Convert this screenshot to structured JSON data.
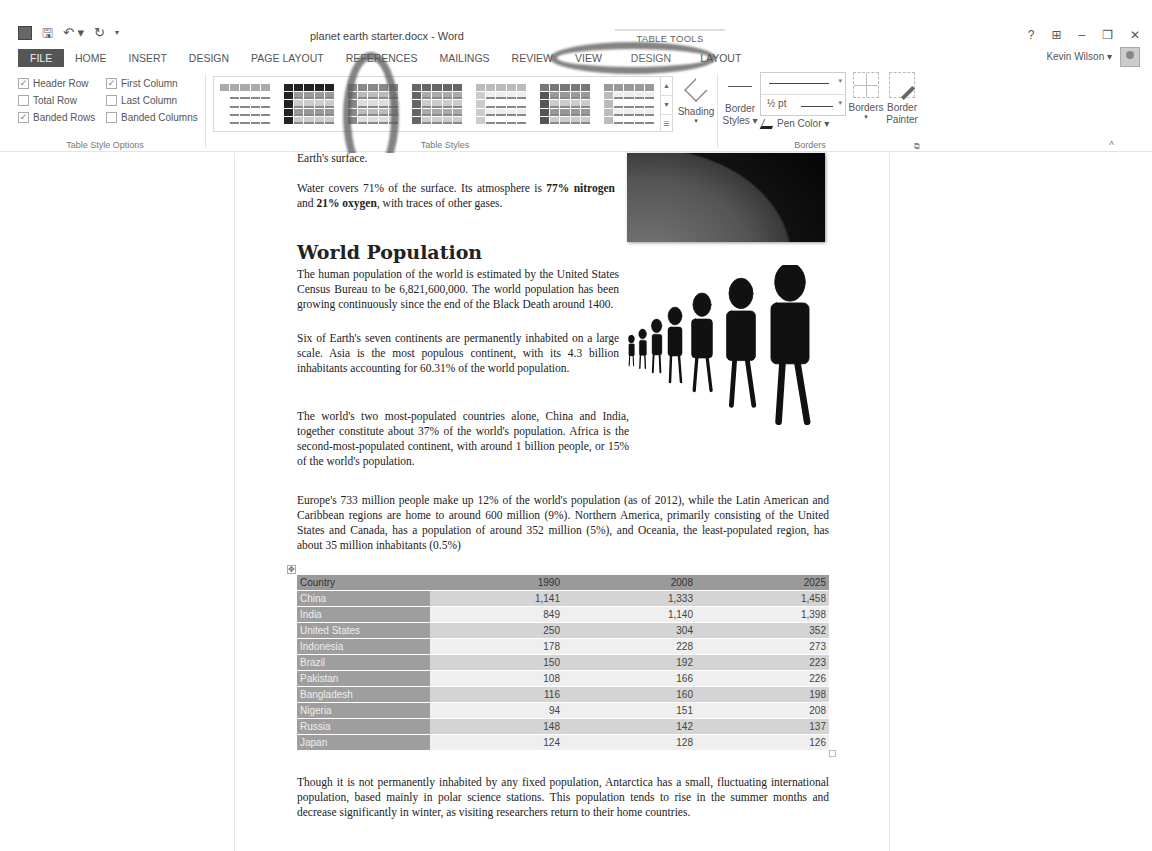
{
  "window": {
    "title": "planet earth starter.docx - Word",
    "context_title": "TABLE TOOLS",
    "controls": [
      "?",
      "⊞",
      "–",
      "❐",
      "✕"
    ],
    "user": "Kevin Wilson ▾"
  },
  "qat": {
    "save": "🖫",
    "undo": "↶ ▾",
    "redo": "↻",
    "customize": "▾"
  },
  "tabs": {
    "file": "FILE",
    "home": "HOME",
    "insert": "INSERT",
    "design": "DESIGN",
    "page_layout": "PAGE LAYOUT",
    "references": "REFERENCES",
    "mailings": "MAILINGS",
    "review": "REVIEW",
    "view": "VIEW",
    "table_design": "DESIGN",
    "table_layout": "LAYOUT"
  },
  "ribbon": {
    "table_style_options": {
      "label": "Table Style Options",
      "options": [
        {
          "label": "Header Row",
          "checked": true
        },
        {
          "label": "First Column",
          "checked": true
        },
        {
          "label": "Total Row",
          "checked": false
        },
        {
          "label": "Last Column",
          "checked": false
        },
        {
          "label": "Banded Rows",
          "checked": true
        },
        {
          "label": "Banded Columns",
          "checked": false
        }
      ]
    },
    "table_styles": {
      "label": "Table Styles",
      "shading": "Shading",
      "shading_caret": "▾",
      "scroll_up": "▲",
      "scroll_down": "▼",
      "more": "☰"
    },
    "borders": {
      "label": "Borders",
      "border_styles": "Border Styles ▾",
      "pen_weight": "½ pt",
      "pen_color": "Pen Color ▾",
      "borders": "Borders",
      "borders_caret": "▾",
      "border_painter": "Border Painter",
      "launcher": "⧉"
    },
    "collapse": "^"
  },
  "document": {
    "fragment": "Earth's surface.",
    "water_para": {
      "pre": "Water covers 71% of the surface. Its atmosphere is ",
      "b1": "77% nitrogen",
      "mid": " and ",
      "b2": "21% oxygen",
      "post": ", with traces of other gases."
    },
    "heading": "World Population",
    "para1": "The human population of the world is estimated by the United States Census Bureau to be 6,821,600,000. The world population has been growing continuously since the end of the Black Death around 1400.",
    "para2": "Six of Earth's seven continents are permanently inhabited on a large scale. Asia is the most populous continent, with its 4.3 billion inhabitants accounting for 60.31% of the world population.",
    "para3": "The world's two most-populated countries alone, China and India, together constitute about 37% of the world's population. Africa is the second-most-populated continent, with around 1 billion people, or 15% of the world's population.",
    "para4": "Europe's 733 million people make up 12% of the world's population (as of 2012), while the Latin American and Caribbean regions are home to around 600 million (9%). Northern America, primarily consisting of the United States and Canada, has a population of around 352 million (5%), and Oceania, the least-populated region, has about 35 million inhabitants (0.5%)",
    "para5": "Though it is not permanently inhabited by any fixed population, Antarctica has a small, fluctuating international population, based mainly in polar science stations. This population tends to rise in the summer months and decrease significantly in winter, as visiting researchers return to their home countries.",
    "table_handle": "✥",
    "table": {
      "headers": [
        "Country",
        "1990",
        "2008",
        "2025"
      ],
      "rows": [
        [
          "China",
          "1,141",
          "1,333",
          "1,458"
        ],
        [
          "India",
          "849",
          "1,140",
          "1,398"
        ],
        [
          "United States",
          "250",
          "304",
          "352"
        ],
        [
          "Indonesia",
          "178",
          "228",
          "273"
        ],
        [
          "Brazil",
          "150",
          "192",
          "223"
        ],
        [
          "Pakistan",
          "108",
          "166",
          "226"
        ],
        [
          "Bangladesh",
          "116",
          "160",
          "198"
        ],
        [
          "Nigeria",
          "94",
          "151",
          "208"
        ],
        [
          "Russia",
          "148",
          "142",
          "137"
        ],
        [
          "Japan",
          "124",
          "128",
          "126"
        ]
      ]
    }
  }
}
